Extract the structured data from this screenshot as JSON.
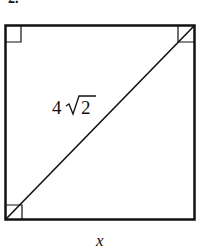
{
  "problem": {
    "number_label": "2."
  },
  "figure": {
    "shape": "square",
    "diagonal_label_coef": "4",
    "diagonal_label_radicand": "2",
    "side_label": "x",
    "right_angle_marks": [
      "top-left",
      "top-right",
      "bottom-left"
    ],
    "stroke_color": "#111111",
    "background_color": "#ffffff"
  }
}
